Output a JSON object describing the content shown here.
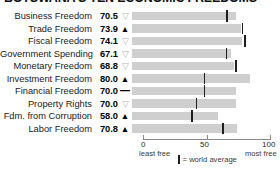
{
  "chart_data": {
    "type": "bar",
    "title": "BOTSWANA'S TEN ECONOMIC FREEDOMS",
    "xlabel": "",
    "ylabel": "",
    "xlim": [
      0,
      100
    ],
    "grid": false,
    "legend_position": "bottom",
    "axis": {
      "ticks": [
        "0",
        "50",
        "100"
      ],
      "tick_values": [
        0,
        50,
        100
      ],
      "left_caption": "least free",
      "right_caption": "most free"
    },
    "legend": {
      "marker": "vertical-tick",
      "label": "= world average"
    },
    "categories": [
      "Business Freedom",
      "Trade Freedom",
      "Fiscal Freedom",
      "Government Spending",
      "Monetary Freedom",
      "Investment Freedom",
      "Financial Freedom",
      "Property Rights",
      "Fdm. from Corruption",
      "Labor Freedom"
    ],
    "values": [
      70.5,
      73.9,
      74.1,
      67.1,
      68.8,
      80.0,
      70.0,
      70.0,
      58.0,
      70.8
    ],
    "value_labels": [
      "70.5",
      "73.9",
      "74.1",
      "67.1",
      "68.8",
      "80.0",
      "70.0",
      "70.0",
      "58.0",
      "70.8"
    ],
    "trend_indicators": [
      "down",
      "up",
      "down",
      "down",
      "down",
      "up",
      "flat",
      "down",
      "up",
      "up"
    ],
    "trend_glyphs": [
      "▽",
      "▲",
      "▽",
      "▽",
      "▽",
      "▲",
      "—",
      "▽",
      "▲",
      "▲"
    ],
    "world_average": [
      64.3,
      74.8,
      76.3,
      63.9,
      70.2,
      49.0,
      49.0,
      43.6,
      40.5,
      61.5
    ],
    "colors": {
      "bar": "#cfcfcf",
      "world_average_tick": "#1f1f1f",
      "axis": "#8a8a8a",
      "text": "#1a1a1a",
      "trend_up": "#000000",
      "trend_down": "#b5b5b5"
    },
    "rows": [
      {
        "label": "Business Freedom",
        "value": 70.5,
        "value_label": "70.5",
        "trend": "▽",
        "trend_kind": "down",
        "world_average": 64.3
      },
      {
        "label": "Trade Freedom",
        "value": 73.9,
        "value_label": "73.9",
        "trend": "▲",
        "trend_kind": "up",
        "world_average": 74.8
      },
      {
        "label": "Fiscal Freedom",
        "value": 74.1,
        "value_label": "74.1",
        "trend": "▽",
        "trend_kind": "down",
        "world_average": 76.3
      },
      {
        "label": "Government Spending",
        "value": 67.1,
        "value_label": "67.1",
        "trend": "▽",
        "trend_kind": "down",
        "world_average": 63.9
      },
      {
        "label": "Monetary Freedom",
        "value": 68.8,
        "value_label": "68.8",
        "trend": "▽",
        "trend_kind": "down",
        "world_average": 70.2
      },
      {
        "label": "Investment Freedom",
        "value": 80.0,
        "value_label": "80.0",
        "trend": "▲",
        "trend_kind": "up",
        "world_average": 49.0
      },
      {
        "label": "Financial Freedom",
        "value": 70.0,
        "value_label": "70.0",
        "trend": "—",
        "trend_kind": "flat",
        "world_average": 49.0
      },
      {
        "label": "Property Rights",
        "value": 70.0,
        "value_label": "70.0",
        "trend": "▽",
        "trend_kind": "down",
        "world_average": 43.6
      },
      {
        "label": "Fdm. from Corruption",
        "value": 58.0,
        "value_label": "58.0",
        "trend": "▲",
        "trend_kind": "up",
        "world_average": 40.5
      },
      {
        "label": "Labor Freedom",
        "value": 70.8,
        "value_label": "70.8",
        "trend": "▲",
        "trend_kind": "up",
        "world_average": 61.5
      }
    ]
  }
}
